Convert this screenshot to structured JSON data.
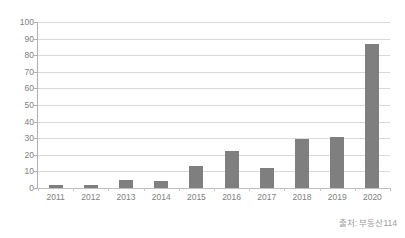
{
  "chart_data": {
    "type": "bar",
    "title": "",
    "xlabel": "",
    "ylabel": "",
    "categories": [
      "2011",
      "2012",
      "2013",
      "2014",
      "2015",
      "2016",
      "2017",
      "2018",
      "2019",
      "2020"
    ],
    "values": [
      2,
      2,
      5,
      4.5,
      13,
      22,
      12,
      29.5,
      31,
      87
    ],
    "ylim": [
      0,
      100
    ],
    "yticks": [
      0,
      10,
      20,
      30,
      40,
      50,
      60,
      70,
      80,
      90,
      100
    ],
    "ytick_labels": [
      "0",
      "10",
      "20",
      "30",
      "40",
      "50",
      "60",
      "70",
      "80",
      "90",
      "100"
    ],
    "grid": true,
    "legend": false,
    "series": [
      {
        "name": "",
        "values": [
          2,
          2,
          5,
          4.5,
          13,
          22,
          12,
          29.5,
          31,
          87
        ],
        "color": "#7f7f7f"
      }
    ],
    "annotations": {
      "source": "출처: 부동산114"
    }
  },
  "figure": {
    "title_fragment": "",
    "source_label": "출처: 부동산114",
    "background_color": "#ffffff",
    "bar_color": "#7f7f7f",
    "grid_color": "#d9d9d9",
    "axis_color": "#b0b0b0",
    "tick_label_color": "#808080"
  }
}
